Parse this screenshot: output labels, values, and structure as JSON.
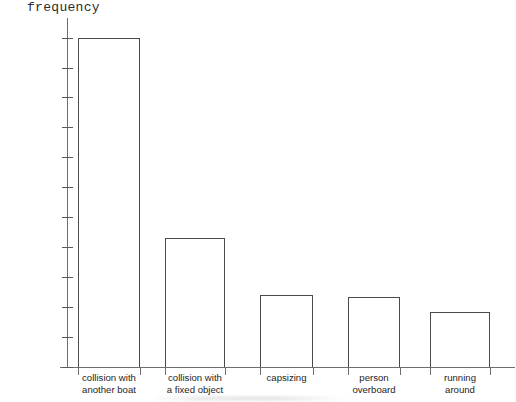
{
  "chart_data": {
    "type": "bar",
    "title": "",
    "subtitle": "",
    "xlabel": "",
    "ylabel": "frequency",
    "ylim": [
      0,
      2200
    ],
    "ytick_step": 200,
    "grid": false,
    "legend": null,
    "categories": [
      "collision with\nanother boat",
      "collision with\na fixed object",
      "capsizing",
      "person\noverboard",
      "running\naround"
    ],
    "values": [
      2200,
      860,
      480,
      465,
      370
    ],
    "ytick_labels": [
      "2200",
      "2000",
      "1800",
      "1600",
      "1400",
      "1200",
      "1000",
      "800",
      "600",
      "400",
      "200",
      "0"
    ],
    "ytick_values": [
      2200,
      2000,
      1800,
      1600,
      1400,
      1200,
      1000,
      800,
      600,
      400,
      200,
      0
    ],
    "bar_style": {
      "fill": "none",
      "outline_color": "#4a4a4a"
    },
    "axis_color": "#6e6e6e"
  }
}
